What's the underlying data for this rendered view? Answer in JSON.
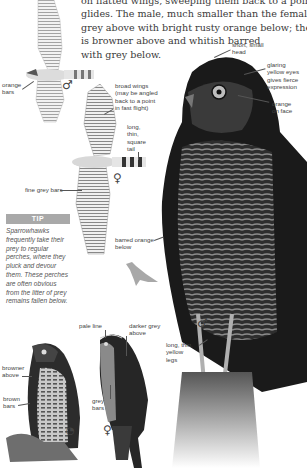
{
  "intro_text": {
    "lines": [
      "on flatted wings, sweeping them back to a point in fast",
      "glides. The male, much smaller than the female, is blue-",
      "grey above with bright rusty orange below; the female",
      "is browner above and whitish barred",
      "with grey below."
    ]
  },
  "flight_male": {
    "sex_symbol": "♂",
    "labels": {
      "orange_bars": "orange\nbars"
    }
  },
  "flight_female": {
    "sex_symbol": "♀",
    "labels": {
      "broad_wings": "broad wings\n(may be angled\nback to a point\nin fast flight)",
      "tail": "long,\nthin,\nsquare\ntail",
      "fine_grey_bars": "fine grey bars"
    }
  },
  "main_perched_male": {
    "sex_symbol": "♂",
    "labels": {
      "head": "short, small\nhead",
      "eyes": "glaring\nyellow eyes\ngives fierce\nexpression",
      "face": "orange\non face",
      "breast": "barred orange\nbelow",
      "legs": "long, thin,\nyellow\nlegs"
    }
  },
  "tip_box": {
    "heading": "TIP",
    "text": "Sparrowhawks frequently take their prey to regular perches, where they pluck and devour them. These perches are often obvious from the litter of prey remains fallen below."
  },
  "juvenile": {
    "sex_symbol": "◔",
    "labels": {
      "above": "browner\nabove",
      "bars": "brown\nbars"
    }
  },
  "perched_female": {
    "sex_symbol": "♀",
    "labels": {
      "pale_line": "pale line",
      "above": "darker grey\nabove",
      "bars": "grey\nbars"
    }
  },
  "colors": {
    "tip_heading_bg": "#a9a9a9",
    "text": "#3a3a3a",
    "silhouette": "#a8a8a8"
  }
}
